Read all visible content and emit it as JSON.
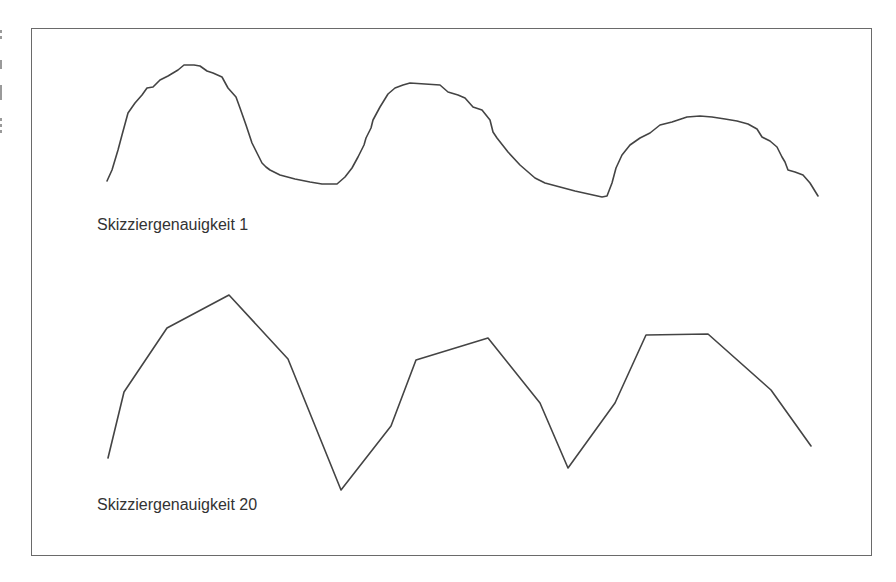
{
  "figure": {
    "title": "",
    "frame": {
      "left": 31,
      "top": 28,
      "right": 873,
      "bottom": 557,
      "color": "#6a6a6a"
    },
    "line_color": "#444444",
    "sketch_low": {
      "label": "Skizziergenauigkeit 1",
      "points": "107,181 112,170 118,150 122,135 128,113 135,103 142,95 147,88 153,87 160,80 168,76 178,70 184,65 194,65 200,66 207,71 213,73 222,77 228,88 236,97 240,108 246,125 252,143 258,155 262,163 266,167 270,170 280,175 295,179 310,182 322,184 337,184 345,177 352,168 358,157 364,145 366,138 371,128 373,120 380,107 388,94 395,88 403,85 410,83 425,84 440,85 448,92 458,95 465,98 473,107 482,110 490,120 493,132 497,138 508,152 520,165 535,178 545,183 560,187 575,191 602,197 607,196 612,183 616,168 622,155 630,145 640,138 650,133 660,125 672,122 687,117 700,116 712,117 725,119 737,121 748,124 757,129 762,137 770,141 777,147 782,157 785,162 788,170 795,172 803,175 810,183 818,196"
    },
    "sketch_high": {
      "label": "Skizziergenauigkeit 20",
      "points": "108,458 124,392 167,328 229,295 288,359 341,490 391,426 416,360 488,338 540,403 568,468 615,403 646,335 708,334 771,390 811,446"
    }
  }
}
